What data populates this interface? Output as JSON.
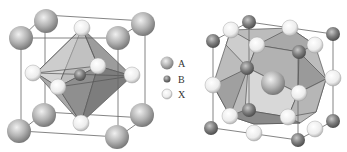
{
  "figure": {
    "left_panel": {
      "name": "cubic perovskite unit cell (BX6 octahedron centered)"
    },
    "right_panel": {
      "name": "perovskite unit cell (A-site centered cuboctahedron)"
    }
  },
  "legend": {
    "items": [
      {
        "symbol": "large-gray-sphere",
        "label": "A"
      },
      {
        "symbol": "small-dark-sphere",
        "label": "B"
      },
      {
        "symbol": "white-sphere",
        "label": "X"
      }
    ]
  },
  "colors": {
    "A": "#9a9a9a",
    "B": "#6e6e6e",
    "X": "#f2f2f2",
    "polyhedron_light": "#c8c8c8",
    "polyhedron_dark": "#8c8c8c",
    "edge": "#555555"
  }
}
